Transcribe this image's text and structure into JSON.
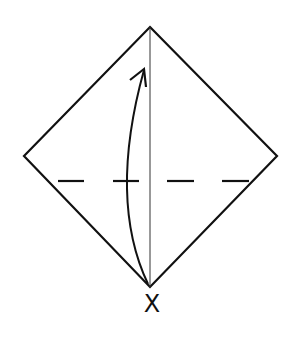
{
  "diagram": {
    "type": "origami-fold-instruction",
    "shape": "square-rotated-45-diamond",
    "vertices": {
      "top": [
        150,
        27
      ],
      "left": [
        24,
        156
      ],
      "right": [
        277,
        156
      ],
      "bottom": [
        150,
        287
      ]
    },
    "center_crease": {
      "style": "thin-solid",
      "from": [
        150,
        27
      ],
      "to": [
        150,
        287
      ]
    },
    "valley_fold_line": {
      "style": "dashed",
      "y": 180,
      "dashes": [
        [
          58,
          84
        ],
        [
          113,
          139
        ],
        [
          167,
          194
        ],
        [
          222,
          249
        ]
      ]
    },
    "arrow": {
      "from": "bottom-corner",
      "to": "near-top",
      "direction": "up",
      "meaning": "fold bottom corner up"
    },
    "corner_label": "X",
    "colors": {
      "line": "#111111",
      "background": "#ffffff"
    }
  }
}
